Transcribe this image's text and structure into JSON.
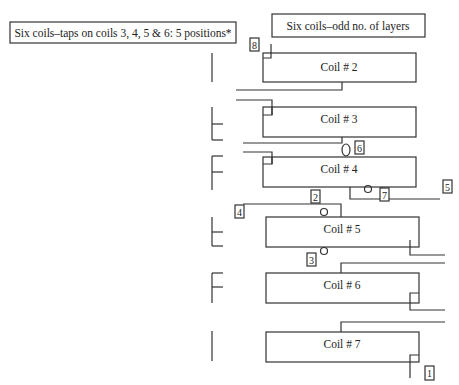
{
  "titles": {
    "left": "Six coils–taps on coils 3, 4, 5 & 6: 5 positions*",
    "right": "Six coils–odd no. of layers"
  },
  "coils": [
    {
      "label": "Coil # 2"
    },
    {
      "label": "Coil # 3"
    },
    {
      "label": "Coil # 4"
    },
    {
      "label": "Coil # 5"
    },
    {
      "label": "Coil # 6"
    },
    {
      "label": "Coil # 7"
    }
  ],
  "taps": {
    "t1": "1",
    "t2": "2",
    "t3": "3",
    "t4": "4",
    "t5": "5",
    "t6": "6",
    "t7": "7",
    "t8": "8"
  },
  "colors": {
    "line": "#333333",
    "background": "#ffffff"
  }
}
